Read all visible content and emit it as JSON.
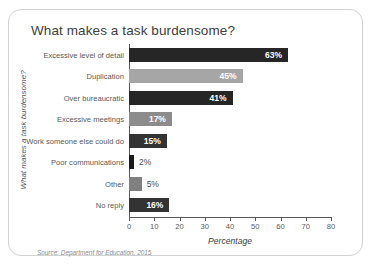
{
  "chart_data": {
    "type": "bar",
    "orientation": "horizontal",
    "title": "What makes a task burdensome?",
    "xlabel": "Percentage",
    "ylabel": "What makes a task burdensome?",
    "xlim": [
      0,
      80
    ],
    "xticks": [
      0,
      10,
      20,
      30,
      40,
      50,
      60,
      70,
      80
    ],
    "grid": false,
    "legend": null,
    "source": "Source: Department for Education, 2015",
    "categories": [
      "Excessive level of detail",
      "Duplication",
      "Over bureaucratic",
      "Excessive meetings",
      "Work someone else could do",
      "Poor communications",
      "Other",
      "No reply"
    ],
    "values": [
      63,
      45,
      41,
      17,
      15,
      2,
      5,
      16
    ],
    "data_labels": [
      "63%",
      "45%",
      "41%",
      "17%",
      "15%",
      "2%",
      "5%",
      "16%"
    ],
    "bar_colors": [
      "#262626",
      "#a6a6a6",
      "#262626",
      "#8c8c8c",
      "#333333",
      "#1a1a1a",
      "#808080",
      "#333333"
    ],
    "label_placement": [
      "inside",
      "inside",
      "inside",
      "inside",
      "inside",
      "outside",
      "outside",
      "inside"
    ]
  },
  "colors": {
    "card_border": "#d2d2d2",
    "axis": "#595959",
    "title_text": "#404040",
    "tick_text": "#595959",
    "source_text": "#8c8c8c"
  }
}
